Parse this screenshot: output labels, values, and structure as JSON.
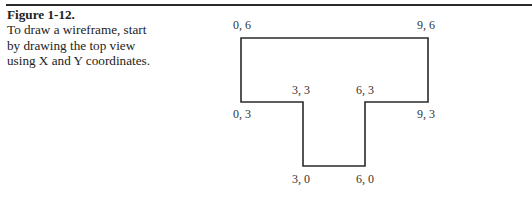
{
  "caption": {
    "title": "Figure 1-12.",
    "text": "To draw a wireframe, start by drawing the top view using X and Y coordinates."
  },
  "diagram": {
    "shape": "T-shaped wireframe top view",
    "points": [
      {
        "label": "0, 6",
        "x": 0,
        "y": 6
      },
      {
        "label": "9, 6",
        "x": 9,
        "y": 6
      },
      {
        "label": "9, 3",
        "x": 9,
        "y": 3
      },
      {
        "label": "6, 3",
        "x": 6,
        "y": 3
      },
      {
        "label": "6, 0",
        "x": 6,
        "y": 0
      },
      {
        "label": "3, 0",
        "x": 3,
        "y": 0
      },
      {
        "label": "3, 3",
        "x": 3,
        "y": 3
      },
      {
        "label": "0, 3",
        "x": 0,
        "y": 3
      }
    ],
    "labels": {
      "p06": "0, 6",
      "p96": "9, 6",
      "p33": "3, 3",
      "p63": "6, 3",
      "p03": "0, 3",
      "p93": "9, 3",
      "p30": "3, 0",
      "p60": "6, 0"
    },
    "line_color": "#2a2a2a"
  }
}
